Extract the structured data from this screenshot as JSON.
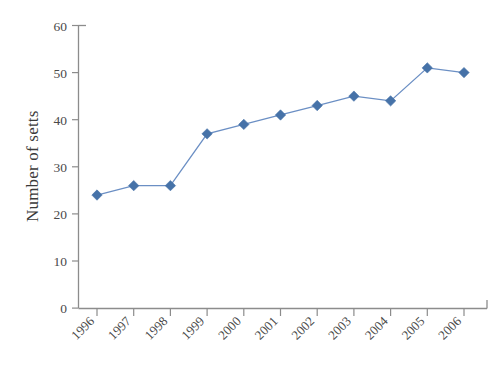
{
  "chart_data": {
    "type": "line",
    "title": "",
    "subtitle": "",
    "xlabel": "",
    "ylabel": "Number of setts",
    "categories": [
      "1996",
      "1997",
      "1998",
      "1999",
      "2000",
      "2001",
      "2002",
      "2003",
      "2004",
      "2005",
      "2006"
    ],
    "values": [
      24,
      26,
      26,
      37,
      39,
      41,
      43,
      45,
      44,
      51,
      50
    ],
    "series": [
      {
        "name": "Number of setts",
        "values": [
          24,
          26,
          26,
          37,
          39,
          41,
          43,
          45,
          44,
          51,
          50
        ]
      }
    ],
    "ylim": [
      0,
      60
    ],
    "yticks": [
      0,
      10,
      20,
      30,
      40,
      50,
      60
    ],
    "ytick_labels": [
      "0",
      "10",
      "20",
      "30",
      "40",
      "50",
      "60"
    ],
    "xtick_labels": [
      "1996",
      "1997",
      "1998",
      "1999",
      "2000",
      "2001",
      "2002",
      "2003",
      "2004",
      "2005",
      "2006"
    ],
    "xtick_rotation_deg": -45,
    "grid": false,
    "legend": null,
    "legend_position": "none",
    "marker": "diamond",
    "colors": {
      "marker": "#4672a8",
      "line": "#6b8fc4",
      "axis": "#8c8c8c",
      "text": "#4a4a4a",
      "background": "#ffffff"
    },
    "annotations": []
  }
}
